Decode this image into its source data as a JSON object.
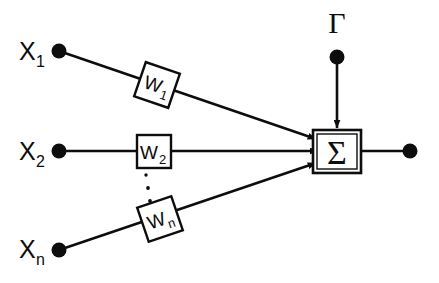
{
  "diagram": {
    "stroke_color": "#0d0d0d",
    "background_color": "#ffffff",
    "inputs": [
      {
        "id": "x1",
        "label": "X",
        "subscript": "1",
        "weight_label": "W",
        "weight_subscript": "1"
      },
      {
        "id": "x2",
        "label": "X",
        "subscript": "2",
        "weight_label": "W",
        "weight_subscript": "2"
      },
      {
        "id": "xn",
        "label": "X",
        "subscript": "n",
        "weight_label": "W",
        "weight_subscript": "n"
      }
    ],
    "bias": {
      "label": "Γ"
    },
    "summation": {
      "label": "Σ"
    },
    "ellipsis": {
      "label": "⋮",
      "dot_count": 3
    }
  }
}
